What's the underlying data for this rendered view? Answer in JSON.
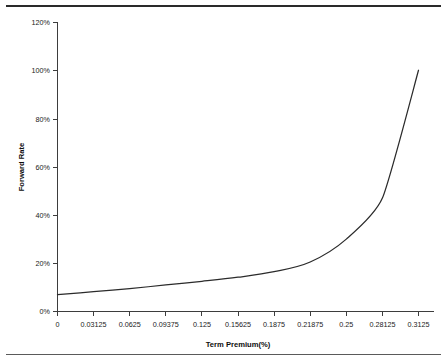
{
  "figure": {
    "title": "",
    "x_axis_title": "Term Premium(%)",
    "y_axis_title": "Forward Rate"
  },
  "axes": {
    "y_ticks": [
      "0%",
      "20%",
      "40%",
      "60%",
      "80%",
      "100%",
      "120%"
    ],
    "x_ticks": [
      "0",
      "0.03125",
      "0.0625",
      "0.09375",
      "0.125",
      "0.15625",
      "0.1875",
      "0.21875",
      "0.25",
      "0.28125",
      "0.3125"
    ]
  },
  "colors": {
    "line": "#2b2b2b",
    "axis": "#3d3d3d",
    "background": "#ffffff",
    "page_rule": "#2a2a2a"
  },
  "chart_data": {
    "type": "line",
    "title": "",
    "xlabel": "Term Premium(%)",
    "ylabel": "Forward Rate",
    "xlim": [
      0,
      0.3125
    ],
    "ylim": [
      0,
      1.2
    ],
    "grid": false,
    "legend": null,
    "x_tick_values": [
      0,
      0.03125,
      0.0625,
      0.09375,
      0.125,
      0.15625,
      0.1875,
      0.21875,
      0.25,
      0.28125,
      0.3125
    ],
    "x_tick_labels": [
      "0",
      "0.03125",
      "0.0625",
      "0.09375",
      "0.125",
      "0.15625",
      "0.1875",
      "0.21875",
      "0.25",
      "0.28125",
      "0.3125"
    ],
    "y_tick_values": [
      0,
      0.2,
      0.4,
      0.6,
      0.8,
      1.0,
      1.2
    ],
    "y_tick_labels": [
      "0%",
      "20%",
      "40%",
      "60%",
      "80%",
      "100%",
      "120%"
    ],
    "series": [
      {
        "name": "Forward Rate",
        "x": [
          0,
          0.03125,
          0.0625,
          0.09375,
          0.125,
          0.15625,
          0.1875,
          0.21875,
          0.25,
          0.28125,
          0.3125
        ],
        "y": [
          0.07,
          0.082,
          0.095,
          0.11,
          0.125,
          0.142,
          0.165,
          0.205,
          0.3,
          0.47,
          1.0
        ],
        "y_percent": [
          "7%",
          "8.2%",
          "9.5%",
          "11%",
          "12.5%",
          "14.2%",
          "16.5%",
          "20.5%",
          "30%",
          "47%",
          "100%"
        ]
      }
    ]
  }
}
